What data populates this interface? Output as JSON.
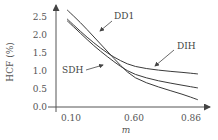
{
  "chart_data": {
    "type": "line",
    "title": "",
    "xlabel": "m",
    "ylabel": "HCF (%)",
    "xticks": [
      "0.10",
      "0.60",
      "0.86"
    ],
    "yticks": [
      "0.0",
      "0.5",
      "1.0",
      "1.5",
      "2.0",
      "2.5"
    ],
    "ylim": [
      0,
      2.5
    ],
    "grid": false,
    "legend": "inline-annotations",
    "series": [
      {
        "name": "DD1",
        "x": [
          0.1,
          0.2,
          0.3,
          0.4,
          0.5,
          0.6,
          0.7,
          0.8,
          0.86
        ],
        "y": [
          2.7,
          2.35,
          1.95,
          1.55,
          1.15,
          0.8,
          0.55,
          0.35,
          0.2
        ]
      },
      {
        "name": "DIH",
        "x": [
          0.1,
          0.2,
          0.3,
          0.4,
          0.5,
          0.6,
          0.7,
          0.8,
          0.86
        ],
        "y": [
          2.45,
          2.1,
          1.78,
          1.5,
          1.28,
          1.12,
          1.02,
          0.96,
          0.92
        ]
      },
      {
        "name": "SDH",
        "x": [
          0.1,
          0.2,
          0.3,
          0.4,
          0.5,
          0.6,
          0.7,
          0.8,
          0.86
        ],
        "y": [
          2.4,
          2.05,
          1.7,
          1.4,
          1.12,
          0.9,
          0.72,
          0.6,
          0.53
        ]
      }
    ],
    "annotations": [
      "DD1",
      "DIH",
      "SDH"
    ]
  }
}
